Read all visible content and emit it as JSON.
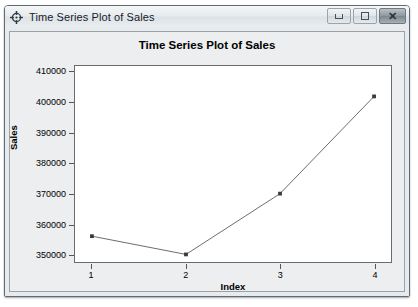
{
  "window": {
    "title": "Time Series Plot of Sales",
    "icon": "compass-crosshair-icon",
    "buttons": {
      "minimize": "minimize-button",
      "maximize": "maximize-button",
      "close": "✕"
    }
  },
  "chart_data": {
    "type": "line",
    "title": "Time Series Plot of Sales",
    "xlabel": "Index",
    "ylabel": "Sales",
    "x": [
      1,
      2,
      3,
      4
    ],
    "values": [
      356000,
      350000,
      370000,
      402000
    ],
    "xticks": [
      "1",
      "2",
      "3",
      "4"
    ],
    "yticks": [
      "350000",
      "360000",
      "370000",
      "380000",
      "390000",
      "400000",
      "410000"
    ],
    "ytick_values": [
      350000,
      360000,
      370000,
      380000,
      390000,
      400000,
      410000
    ],
    "xlim": [
      0.82,
      4.18
    ],
    "ylim": [
      347500,
      412000
    ],
    "grid": false,
    "legend": "none",
    "marker": "filled-square",
    "line_color": "#6b6b6b",
    "marker_color": "#3a3a3a"
  }
}
